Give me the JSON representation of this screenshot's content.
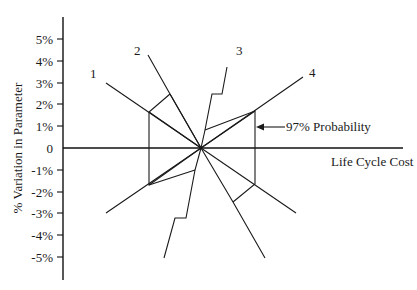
{
  "diagram": {
    "type": "spider-plot",
    "y_axis": {
      "title": "% Variation in Parameter",
      "ticks": [
        "5%",
        "4%",
        "3%",
        "2%",
        "1%",
        "0",
        "-1%",
        "-2%",
        "-3%",
        "-4%",
        "-5%"
      ]
    },
    "x_axis": {
      "title": "Life Cycle Cost"
    },
    "series_labels": [
      "1",
      "2",
      "3",
      "4"
    ],
    "annotation": "97% Probability",
    "colors": {
      "line": "#1a1a1a",
      "background": "#ffffff"
    }
  }
}
